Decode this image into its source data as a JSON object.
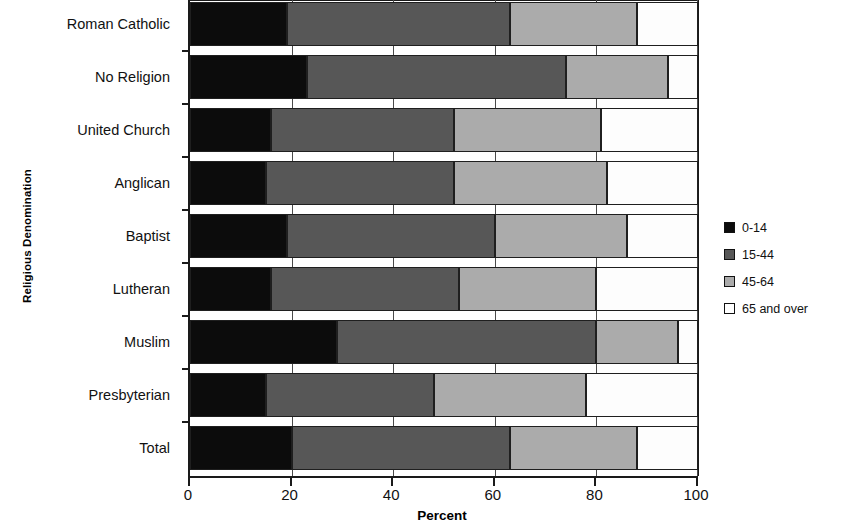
{
  "chart_data": {
    "type": "bar",
    "subtype": "stacked-horizontal-100",
    "title": "",
    "xlabel": "Percent",
    "ylabel": "Religious Denomination",
    "xlim": [
      0,
      100
    ],
    "xticks": [
      0,
      20,
      40,
      60,
      80,
      100
    ],
    "xtick_labels": [
      "0",
      "20",
      "40",
      "60",
      "80",
      "100"
    ],
    "grid": true,
    "legend_position": "right",
    "categories": [
      "Roman Catholic",
      "No Religion",
      "United Church",
      "Anglican",
      "Baptist",
      "Lutheran",
      "Muslim",
      "Presbyterian",
      "Total"
    ],
    "series": [
      {
        "name": "0-14",
        "color": "#0c0c0c",
        "values": [
          19,
          23,
          16,
          15,
          19,
          16,
          29,
          15,
          20
        ]
      },
      {
        "name": "15-44",
        "color": "#575757",
        "values": [
          44,
          51,
          36,
          37,
          41,
          37,
          51,
          33,
          43
        ]
      },
      {
        "name": "45-64",
        "color": "#ababab",
        "values": [
          25,
          20,
          29,
          30,
          26,
          27,
          16,
          30,
          25
        ]
      },
      {
        "name": "65 and over",
        "color": "#ffffff",
        "values": [
          12,
          6,
          19,
          18,
          14,
          20,
          4,
          22,
          12
        ]
      }
    ]
  },
  "axes": {
    "x_title": "Percent",
    "y_title": "Religious Denomination"
  },
  "legend": {
    "items": [
      {
        "label": "0-14",
        "color": "#0c0c0c"
      },
      {
        "label": "15-44",
        "color": "#575757"
      },
      {
        "label": "45-64",
        "color": "#ababab"
      },
      {
        "label": "65 and over",
        "color": "#ffffff"
      }
    ]
  }
}
